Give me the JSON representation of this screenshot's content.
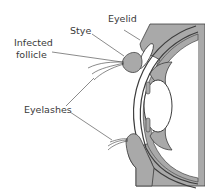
{
  "labels": {
    "eyelid": "Eyelid",
    "stye": "Stye",
    "infected_follicle_line1": "Infected",
    "infected_follicle_line2": "follicle",
    "eyelashes": "Eyelashes"
  },
  "colors": {
    "tissue_fill": "#a9a9a9",
    "outline": "#3c3c3c",
    "background": "#ffffff",
    "text": "#3a3a3a"
  }
}
